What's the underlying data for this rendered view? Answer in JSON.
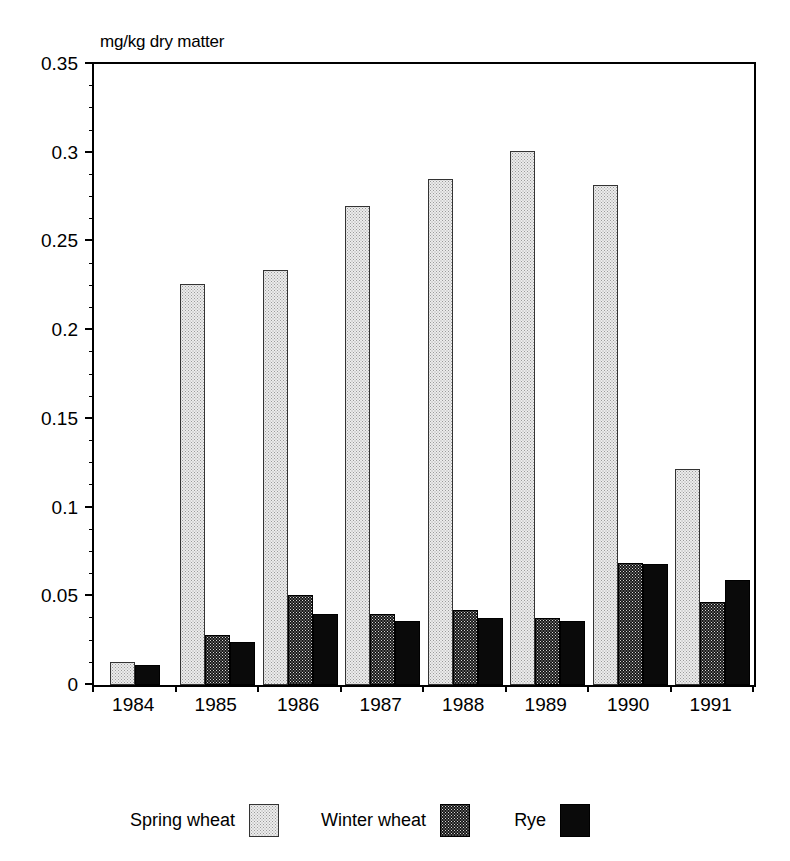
{
  "chart_data": {
    "type": "bar",
    "title": "",
    "subtitle": "",
    "xlabel": "",
    "ylabel": "mg/kg dry matter",
    "unit_caption": "mg/kg dry matter",
    "categories": [
      "1984",
      "1985",
      "1986",
      "1987",
      "1988",
      "1989",
      "1990",
      "1991"
    ],
    "series": [
      {
        "name": "Spring wheat",
        "style": "light-stipple",
        "color": "#ececec",
        "values": [
          0.013,
          null,
          null,
          null,
          null,
          null,
          null,
          null
        ]
      },
      {
        "name": "Winter wheat",
        "style": "light-stipple",
        "color": "#ececec",
        "values": [
          null,
          0.226,
          0.234,
          0.27,
          0.285,
          0.301,
          0.282,
          0.122
        ]
      },
      {
        "name": "Rye",
        "style": "dark-stipple",
        "color": "#171717",
        "values": [
          null,
          0.028,
          0.051,
          0.04,
          0.042,
          0.038,
          0.069,
          0.047
        ]
      },
      {
        "name": "",
        "style": "solid-black",
        "color": "#0a0a0a",
        "values": [
          0.011,
          0.024,
          0.04,
          0.036,
          0.038,
          0.036,
          0.068,
          0.059
        ]
      }
    ],
    "ylim": [
      0,
      0.35
    ],
    "ytick_values": [
      0,
      0.05,
      0.1,
      0.15,
      0.2,
      0.25,
      0.3,
      0.35
    ],
    "ytick_labels": [
      "0",
      "0.05",
      "0.1",
      "0.15",
      "0.2",
      "0.25",
      "0.3",
      "0.35"
    ],
    "yminor_step": 0.0125,
    "grid": false,
    "legend_position": "bottom"
  },
  "axis": {
    "unit_caption": "mg/kg dry matter",
    "y_labels": [
      "0.35",
      "0.3",
      "0.25",
      "0.2",
      "0.15",
      "0.1",
      "0.05",
      "0"
    ],
    "x_labels": [
      "1984",
      "1985",
      "1986",
      "1987",
      "1988",
      "1989",
      "1990",
      "1991"
    ]
  },
  "legend": {
    "entries": [
      {
        "label": "Spring wheat",
        "swatch": "light-stipple-swatch"
      },
      {
        "label": "Winter wheat",
        "swatch": "dark-stipple-swatch"
      },
      {
        "label": "Rye",
        "swatch": "solid-black-swatch"
      }
    ]
  }
}
